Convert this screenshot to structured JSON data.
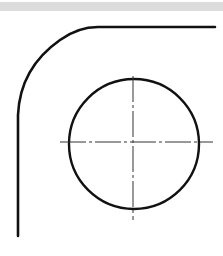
{
  "diagram": {
    "type": "technical-drawing",
    "colors": {
      "outline": "#111111",
      "centerline": "#333333",
      "band": "#dcdcdc"
    },
    "elements": [
      {
        "name": "outer-profile",
        "kind": "path",
        "description": "horizontal edge joined by rounded corner to vertical edge"
      },
      {
        "name": "circle",
        "kind": "circle",
        "cx": 134,
        "cy": 144,
        "r": 65
      },
      {
        "name": "horizontal-centerline",
        "kind": "dash-dot-line"
      },
      {
        "name": "vertical-centerline",
        "kind": "dash-dot-line"
      }
    ]
  }
}
